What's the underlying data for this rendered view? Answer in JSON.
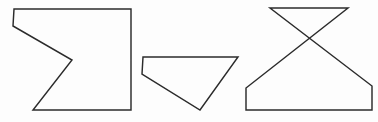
{
  "figure": {
    "canvas": {
      "width": 378,
      "height": 122,
      "background_color": "#fdfdfd"
    },
    "style": {
      "stroke_color": "#2b2b2b",
      "stroke_width": 1.45,
      "fill": "none"
    },
    "shapes": [
      {
        "id": "shape-1",
        "name": "notched-square-polygon",
        "label": "Concave hexagon with V-shaped notch on the left side",
        "vertex_count": 6,
        "points": "14,9 131,9 131,110 33,110 72,60 13,26",
        "vertices": [
          [
            14,
            9
          ],
          [
            131,
            9
          ],
          [
            131,
            110
          ],
          [
            33,
            110
          ],
          [
            72,
            60
          ],
          [
            13,
            26
          ]
        ]
      },
      {
        "id": "shape-2",
        "name": "quadrilateral-polygon",
        "label": "Irregular quadrilateral, wide at top narrowing to a bottom point",
        "vertex_count": 4,
        "points": "143,57 238,57 200,110 142,74",
        "vertices": [
          [
            143,
            57
          ],
          [
            238,
            57
          ],
          [
            200,
            110
          ],
          [
            142,
            74
          ]
        ]
      },
      {
        "id": "shape-3",
        "name": "bowtie-trapezoid-polygon",
        "label": "Self-intersecting bowtie shape: inverted triangle crossing over a trapezoid",
        "vertex_count": 6,
        "points": "270,8 348,8 246,88 246,110 372,110 372,86",
        "vertices": [
          [
            270,
            8
          ],
          [
            348,
            8
          ],
          [
            246,
            88
          ],
          [
            246,
            110
          ],
          [
            372,
            110
          ],
          [
            372,
            86
          ]
        ],
        "crossing_point": [
          308,
          62
        ]
      }
    ]
  }
}
